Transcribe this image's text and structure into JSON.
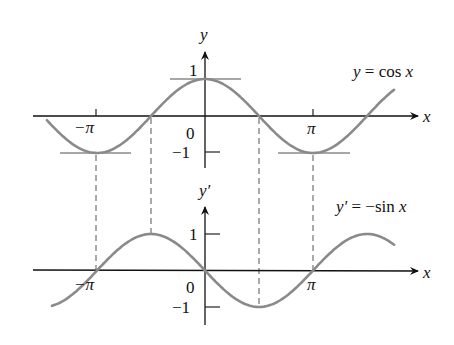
{
  "chart_data": [
    {
      "type": "line",
      "title": "y = cos x",
      "xlabel": "x",
      "ylabel": "y",
      "x_ticks": [
        "−π",
        "0",
        "π"
      ],
      "y_ticks": [
        "1",
        "−1"
      ],
      "xlim_radians": [
        -4.6,
        5.5
      ],
      "ylim": [
        -1.4,
        1.9
      ],
      "series": [
        {
          "name": "y = cos x",
          "function": "cos(x)",
          "x_range": [
            -4.6,
            5.5
          ],
          "color": "#8a8a8a"
        }
      ],
      "annotations": [
        "horizontal tangent at x=0 (y=1)",
        "horizontal tangent at x=−π (y=−1)",
        "horizontal tangent at x=π (y=−1)"
      ],
      "grid": false
    },
    {
      "type": "line",
      "title": "y′ = −sin x",
      "xlabel": "x",
      "ylabel": "y′",
      "x_ticks": [
        "−π",
        "0",
        "π"
      ],
      "y_ticks": [
        "1",
        "−1"
      ],
      "xlim_radians": [
        -4.6,
        5.6
      ],
      "ylim": [
        -1.5,
        1.8
      ],
      "series": [
        {
          "name": "y′ = −sin x",
          "function": "-sin(x)",
          "x_range": [
            -4.45,
            5.5
          ],
          "color": "#8a8a8a"
        }
      ],
      "annotations": [
        "dashed guides at x = −π, −π/2, π/2, π linking the two graphs"
      ],
      "grid": false
    }
  ],
  "top": {
    "axis_x_label": "x",
    "axis_y_label": "y",
    "tick_neg_pi": "−π",
    "tick_zero": "0",
    "tick_pi": "π",
    "tick_one": "1",
    "tick_neg_one": "−1",
    "equation_lhs": "y",
    "equation_eq": " = cos ",
    "equation_var": "x"
  },
  "bottom": {
    "axis_x_label": "x",
    "axis_y_label": "y′",
    "tick_neg_pi": "−π",
    "tick_zero": "0",
    "tick_pi": "π",
    "tick_one": "1",
    "tick_neg_one": "−1",
    "equation_lhs": "y′",
    "equation_eq": " = −sin ",
    "equation_var": "x"
  },
  "style": {
    "curve_color": "#8a8a8a",
    "axis_color": "#111111"
  }
}
